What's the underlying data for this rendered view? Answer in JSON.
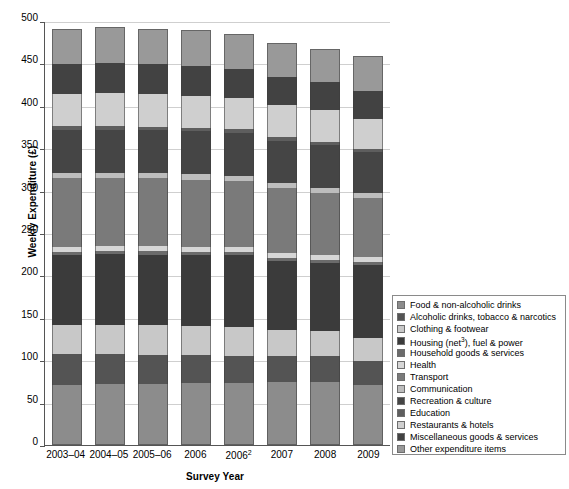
{
  "chart_data": {
    "type": "bar",
    "stacked": true,
    "title": "",
    "xlabel": "Survey Year",
    "ylabel": "Weekly Expenditure (£)",
    "ylim": [
      0,
      500
    ],
    "ytick_step": 50,
    "yticks": [
      0,
      50,
      100,
      150,
      200,
      250,
      300,
      350,
      400,
      450,
      500
    ],
    "grid": true,
    "legend_position": "right-bottom",
    "categories": [
      "2003–04",
      "2004–05",
      "2005–06",
      "2006",
      "2006²",
      "2007",
      "2008",
      "2009"
    ],
    "series": [
      {
        "name": "Food & non-alcoholic drinks",
        "color": "#8c8c8c",
        "values": [
          71.0,
          72.0,
          72.5,
          73.0,
          73.5,
          74.0,
          74.5,
          71.0
        ]
      },
      {
        "name": "Alcoholic drinks, tobacco & narcotics",
        "color": "#545454",
        "values": [
          36.0,
          35.0,
          34.0,
          33.0,
          32.0,
          31.0,
          30.0,
          28.0
        ]
      },
      {
        "name": "Clothing & footwear",
        "color": "#c8c8c8",
        "values": [
          35.0,
          35.0,
          34.5,
          34.0,
          33.5,
          31.0,
          30.0,
          27.0
        ]
      },
      {
        "name": "Housing (net³), fuel & power",
        "color": "#3b3b3b",
        "values": [
          82.0,
          83.0,
          83.5,
          84.0,
          84.5,
          81.0,
          80.0,
          86.0
        ]
      },
      {
        "name": "Household goods & services",
        "color": "#6b6b6b",
        "values": [
          4.0,
          4.0,
          4.0,
          4.0,
          4.0,
          4.0,
          4.0,
          4.0
        ]
      },
      {
        "name": "Health",
        "color": "#d6d6d6",
        "values": [
          6.0,
          6.0,
          6.0,
          6.0,
          6.0,
          6.0,
          6.0,
          6.0
        ]
      },
      {
        "name": "Transport",
        "color": "#7a7a7a",
        "values": [
          81.0,
          80.0,
          80.0,
          79.0,
          78.0,
          76.0,
          73.0,
          69.0
        ]
      },
      {
        "name": "Communication",
        "color": "#bdbdbd",
        "values": [
          6.0,
          6.0,
          6.0,
          6.0,
          6.0,
          6.0,
          6.0,
          6.0
        ]
      },
      {
        "name": "Recreation & culture",
        "color": "#454545",
        "values": [
          51.0,
          51.0,
          51.0,
          51.0,
          51.0,
          50.0,
          50.0,
          48.0
        ]
      },
      {
        "name": "Education",
        "color": "#5e5e5e",
        "values": [
          4.0,
          4.0,
          4.0,
          4.0,
          4.0,
          4.0,
          4.0,
          4.0
        ]
      },
      {
        "name": "Restaurants & hotels",
        "color": "#cfcfcf",
        "values": [
          38.0,
          39.0,
          38.5,
          38.0,
          37.0,
          38.0,
          37.0,
          36.0
        ]
      },
      {
        "name": "Miscellaneous goods & services",
        "color": "#424242",
        "values": [
          35.0,
          35.0,
          35.0,
          35.0,
          34.0,
          33.0,
          33.0,
          32.0
        ]
      },
      {
        "name": "Other expenditure items",
        "color": "#999999",
        "values": [
          41.0,
          43.0,
          42.0,
          42.0,
          41.0,
          40.0,
          40.0,
          42.0
        ]
      }
    ],
    "totals": [
      490,
      493,
      491,
      489,
      484.5,
      474,
      467.5,
      455
    ]
  },
  "legend": {
    "items": [
      "Food & non-alcoholic drinks",
      "Alcoholic drinks, tobacco & narcotics",
      "Clothing & footwear",
      "Housing (net),fuel & power",
      "Household goods & services",
      "Health",
      "Transport",
      "Communication",
      "Recreation & culture",
      "Education",
      "Restaurants & hotels",
      "Miscellaneous goods & services",
      "Other expenditure items"
    ]
  }
}
